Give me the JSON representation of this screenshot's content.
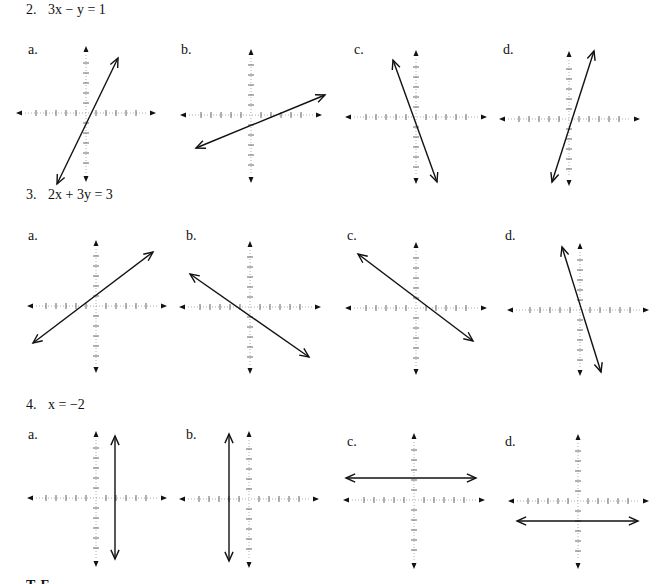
{
  "problems": [
    {
      "number": "2.",
      "equation": "3x − y = 1",
      "title_pos": [
        26,
        2
      ],
      "options": [
        {
          "label": "a.",
          "label_pos": [
            28,
            42
          ],
          "origin": [
            86,
            113
          ],
          "axis": {
            "top": 49,
            "bottom": 179,
            "left": 19,
            "right": 153
          },
          "line": [
            [
              118,
              58
            ],
            [
              57,
              184
            ]
          ]
        },
        {
          "label": "b.",
          "label_pos": [
            181,
            42
          ],
          "origin": [
            251,
            115
          ],
          "axis": {
            "top": 52,
            "bottom": 180,
            "left": 183,
            "right": 319
          },
          "line": [
            [
              196,
              148
            ],
            [
              325,
              95
            ]
          ]
        },
        {
          "label": "c.",
          "label_pos": [
            354,
            42
          ],
          "origin": [
            416,
            117
          ],
          "axis": {
            "top": 53,
            "bottom": 181,
            "left": 348,
            "right": 484
          },
          "line": [
            [
              393,
              60
            ],
            [
              437,
              182
            ]
          ]
        },
        {
          "label": "d.",
          "label_pos": [
            503,
            42
          ],
          "origin": [
            569,
            119
          ],
          "axis": {
            "top": 54,
            "bottom": 183,
            "left": 502,
            "right": 637
          },
          "line": [
            [
              594,
              51
            ],
            [
              552,
              182
            ]
          ]
        }
      ]
    },
    {
      "number": "3.",
      "equation": "2x + 3y = 3",
      "title_pos": [
        26,
        187
      ],
      "options": [
        {
          "label": "a.",
          "label_pos": [
            28,
            228
          ],
          "origin": [
            96,
            306
          ],
          "axis": {
            "top": 243,
            "bottom": 370,
            "left": 30,
            "right": 164
          },
          "line": [
            [
              153,
              252
            ],
            [
              33,
              343
            ]
          ]
        },
        {
          "label": "b.",
          "label_pos": [
            186,
            228
          ],
          "origin": [
            250,
            307
          ],
          "axis": {
            "top": 244,
            "bottom": 371,
            "left": 182,
            "right": 318
          },
          "line": [
            [
              190,
              274
            ],
            [
              309,
              357
            ]
          ]
        },
        {
          "label": "c.",
          "label_pos": [
            347,
            228
          ],
          "origin": [
            416,
            308
          ],
          "axis": {
            "top": 245,
            "bottom": 372,
            "left": 348,
            "right": 484
          },
          "line": [
            [
              358,
              254
            ],
            [
              473,
              341
            ]
          ]
        },
        {
          "label": "d.",
          "label_pos": [
            505,
            228
          ],
          "origin": [
            580,
            310
          ],
          "axis": {
            "top": 246,
            "bottom": 373,
            "left": 510,
            "right": 646
          },
          "line": [
            [
              562,
              247
            ],
            [
              601,
              372
            ]
          ]
        }
      ]
    },
    {
      "number": "4.",
      "equation": "x = −2",
      "title_pos": [
        26,
        397
      ],
      "options": [
        {
          "label": "a.",
          "label_pos": [
            28,
            427
          ],
          "origin": [
            96,
            498
          ],
          "axis": {
            "top": 434,
            "bottom": 564,
            "left": 30,
            "right": 164
          },
          "line": [
            [
              115,
              436
            ],
            [
              115,
              559
            ]
          ]
        },
        {
          "label": "b.",
          "label_pos": [
            186,
            427
          ],
          "origin": [
            249,
            499
          ],
          "axis": {
            "top": 434,
            "bottom": 565,
            "left": 182,
            "right": 316
          },
          "line": [
            [
              229,
              434
            ],
            [
              229,
              561
            ]
          ]
        },
        {
          "label": "c.",
          "label_pos": [
            347,
            434
          ],
          "origin": [
            414,
            500
          ],
          "axis": {
            "top": 436,
            "bottom": 566,
            "left": 346,
            "right": 482
          },
          "line": [
            [
              346,
              478
            ],
            [
              476,
              478
            ]
          ]
        },
        {
          "label": "d.",
          "label_pos": [
            505,
            434
          ],
          "origin": [
            578,
            501
          ],
          "axis": {
            "top": 437,
            "bottom": 566,
            "left": 511,
            "right": 646
          },
          "line": [
            [
              517,
              521
            ],
            [
              638,
              521
            ]
          ]
        }
      ]
    }
  ],
  "graph_style": {
    "tick_spacing": 10,
    "tick_count": 5,
    "tick_half_length": 3,
    "axis_color": "#9a9a9a",
    "tick_color": "#555555",
    "line_color": "#111111"
  },
  "footer_cutoff_text": "T  F  ..."
}
